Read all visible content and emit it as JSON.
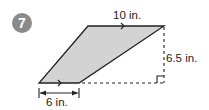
{
  "problem": {
    "number": "7"
  },
  "figure": {
    "shape": "parallelogram",
    "fill_color": "#d3d3d3",
    "stroke_color": "#222222",
    "vertices": {
      "top_left": [
        88,
        26
      ],
      "top_right": [
        164,
        26
      ],
      "bottom_right": [
        79,
        83
      ],
      "bottom_left": [
        39,
        83
      ]
    },
    "labels": {
      "top_side": "10 in.",
      "height": "6.5 in.",
      "bottom_side": "6 in."
    },
    "annotations": {
      "parallel_marks": [
        "top side arrow",
        "bottom side arrow"
      ],
      "height_line": "dashed",
      "base_extension": "dashed",
      "right_angle_marker": true,
      "dimension_arrow": "double-headed under bottom side"
    }
  }
}
